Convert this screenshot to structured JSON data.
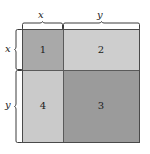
{
  "figure": {
    "type": "geometric-area-diagram",
    "background_color": "#ffffff"
  },
  "square": {
    "outline_color": "#4a4a4a",
    "divider_color": "#5a5a5a",
    "regions": [
      {
        "number": "1",
        "position": "top-left",
        "dimensions": "x by x",
        "fill": "#a9a9a9"
      },
      {
        "number": "2",
        "position": "top-right",
        "dimensions": "x by y",
        "fill": "#cecece"
      },
      {
        "number": "3",
        "position": "bottom-right",
        "dimensions": "y by y",
        "fill": "#9b9b9b"
      },
      {
        "number": "4",
        "position": "bottom-left",
        "dimensions": "y by x",
        "fill": "#cacaca"
      }
    ]
  },
  "braces": {
    "top": [
      {
        "label": "x",
        "spans": "region-1-width"
      },
      {
        "label": "y",
        "spans": "region-2-width"
      }
    ],
    "left": [
      {
        "label": "x",
        "spans": "region-1-height"
      },
      {
        "label": "y",
        "spans": "region-4-height"
      }
    ]
  },
  "labels": {
    "top_x": "x",
    "top_y": "y",
    "left_x": "x",
    "left_y": "y",
    "region_1": "1",
    "region_2": "2",
    "region_3": "3",
    "region_4": "4"
  }
}
